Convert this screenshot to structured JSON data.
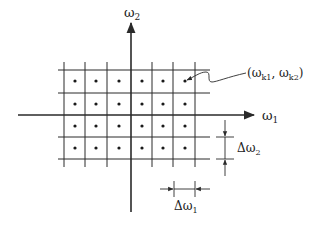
{
  "diagram": {
    "type": "2D frequency sampling lattice",
    "axes": {
      "horizontal": {
        "label": "ω",
        "subscript": "1"
      },
      "vertical": {
        "label": "ω",
        "subscript": "2"
      }
    },
    "grid": {
      "columns_x": [
        64,
        85,
        107,
        131,
        152,
        173,
        195
      ],
      "rows_y": [
        70,
        93,
        115,
        137,
        159
      ],
      "dot_cols_x": [
        75,
        96,
        119,
        142,
        163,
        185
      ],
      "dot_rows_y": [
        81,
        104,
        126,
        148
      ]
    },
    "annotations": {
      "point_label": {
        "prefix": "(ω",
        "sub1": "k1",
        "mid": ", ω",
        "sub2": "k2",
        "suffix": ")"
      },
      "delta_omega_1": {
        "label": "Δω",
        "subscript": "1"
      },
      "delta_omega_2": {
        "label": "Δω",
        "subscript": "2"
      }
    },
    "colors": {
      "line": "#2a2a2a",
      "text": "#222222"
    }
  }
}
